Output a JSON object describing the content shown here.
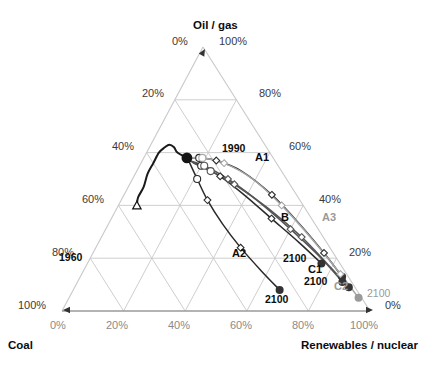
{
  "axes": {
    "top_title": "Oil / gas",
    "bottom_left_title": "Coal",
    "bottom_right_title": "Renewables / nuclear",
    "apex_left_tick": "0%",
    "apex_right_tick": "100%",
    "left_ticks": [
      "20%",
      "40%",
      "60%",
      "80%",
      "100%"
    ],
    "right_ticks": [
      "80%",
      "60%",
      "40%",
      "20%",
      "0%"
    ],
    "bottom_ticks": [
      "0%",
      "20%",
      "40%",
      "60%",
      "80%",
      "100%"
    ]
  },
  "annotations": {
    "historic_start": "1960",
    "branch_point": "1990",
    "a1": "A1",
    "a2": "A2",
    "a3": "A3",
    "b": "B",
    "c1": "C1",
    "c2": "C2",
    "end_a2": "2100",
    "end_b": "2100",
    "end_c1": "2100",
    "end_a3": "2100"
  },
  "colors": {
    "grid": "#c8c8c8",
    "axis": "#9a9a9a",
    "historic_line": "#1a1a1a",
    "scenario_dark": "#2a2a2a",
    "scenario_mid": "#555555",
    "scenario_light": "#a8a8a8",
    "marker_fill": "#ffffff",
    "endpoint_dark": "#333333",
    "endpoint_gray": "#9a9a9a",
    "text": "#111111",
    "text_gray": "#8a8a8a"
  },
  "chart_data": {
    "type": "line",
    "title": "",
    "subtitle": "",
    "plot_kind": "ternary",
    "axis_labels": {
      "top": "Oil / gas",
      "left": "Coal",
      "right": "Renewables / nuclear"
    },
    "axis_ranges": {
      "oil_gas": [
        0,
        100
      ],
      "coal": [
        0,
        100
      ],
      "renewables_nuclear": [
        0,
        100
      ]
    },
    "grid": true,
    "grid_interval": 20,
    "legend": "none",
    "units": "percent of primary energy",
    "note": "Each point is a share triple (coal, oil/gas, renewables+nuclear) summing to 100%.",
    "series": [
      {
        "name": "Historical 1960-1990",
        "style": "solid-black",
        "marker_start": "open-triangle",
        "marker_end": "large-filled-circle",
        "points": [
          {
            "label": "1960",
            "coal": 54,
            "oil_gas": 40,
            "ren_nuc": 6
          },
          {
            "coal": 52,
            "oil_gas": 43,
            "ren_nuc": 5
          },
          {
            "coal": 48,
            "oil_gas": 47,
            "ren_nuc": 5
          },
          {
            "coal": 44,
            "oil_gas": 52,
            "ren_nuc": 4
          },
          {
            "coal": 40,
            "oil_gas": 56,
            "ren_nuc": 4
          },
          {
            "coal": 36,
            "oil_gas": 60,
            "ren_nuc": 4
          },
          {
            "coal": 33,
            "oil_gas": 62,
            "ren_nuc": 5
          },
          {
            "coal": 31,
            "oil_gas": 63,
            "ren_nuc": 6
          },
          {
            "coal": 30,
            "oil_gas": 62,
            "ren_nuc": 8
          },
          {
            "coal": 30,
            "oil_gas": 60,
            "ren_nuc": 10
          },
          {
            "label": "1990",
            "coal": 28,
            "oil_gas": 58,
            "ren_nuc": 14
          }
        ]
      },
      {
        "name": "A1",
        "style": "solid-dark",
        "marker": "open-diamond",
        "marker_end": "filled-circle",
        "points": [
          {
            "coal": 28,
            "oil_gas": 58,
            "ren_nuc": 14
          },
          {
            "coal": 24,
            "oil_gas": 58,
            "ren_nuc": 18
          },
          {
            "coal": 19,
            "oil_gas": 57,
            "ren_nuc": 24
          },
          {
            "coal": 13,
            "oil_gas": 53,
            "ren_nuc": 34
          },
          {
            "coal": 8,
            "oil_gas": 44,
            "ren_nuc": 48
          },
          {
            "coal": 5,
            "oil_gas": 33,
            "ren_nuc": 62
          },
          {
            "coal": 3,
            "oil_gas": 22,
            "ren_nuc": 75
          },
          {
            "label": "2100",
            "coal": 2,
            "oil_gas": 13,
            "ren_nuc": 85
          }
        ]
      },
      {
        "name": "A2",
        "style": "solid-dark",
        "marker": "open-diamond",
        "marker_end": "filled-circle",
        "points": [
          {
            "coal": 28,
            "oil_gas": 57,
            "ren_nuc": 15
          },
          {
            "coal": 29,
            "oil_gas": 50,
            "ren_nuc": 21
          },
          {
            "coal": 30,
            "oil_gas": 42,
            "ren_nuc": 28
          },
          {
            "coal": 30,
            "oil_gas": 33,
            "ren_nuc": 37
          },
          {
            "coal": 29,
            "oil_gas": 24,
            "ren_nuc": 47
          },
          {
            "coal": 27,
            "oil_gas": 15,
            "ren_nuc": 58
          },
          {
            "label": "2100",
            "coal": 25,
            "oil_gas": 8,
            "ren_nuc": 67
          }
        ]
      },
      {
        "name": "A3",
        "style": "solid-light-gray",
        "marker": "open-diamond",
        "marker_end": "filled-circle-gray",
        "points": [
          {
            "coal": 28,
            "oil_gas": 58,
            "ren_nuc": 14
          },
          {
            "coal": 23,
            "oil_gas": 58,
            "ren_nuc": 19
          },
          {
            "coal": 17,
            "oil_gas": 56,
            "ren_nuc": 27
          },
          {
            "coal": 11,
            "oil_gas": 50,
            "ren_nuc": 39
          },
          {
            "coal": 7,
            "oil_gas": 40,
            "ren_nuc": 53
          },
          {
            "coal": 4,
            "oil_gas": 27,
            "ren_nuc": 69
          },
          {
            "coal": 2,
            "oil_gas": 14,
            "ren_nuc": 84
          },
          {
            "label": "2100",
            "coal": 1,
            "oil_gas": 5,
            "ren_nuc": 94
          }
        ]
      },
      {
        "name": "B",
        "style": "solid-dark",
        "marker": "open-diamond",
        "marker_end": "filled-circle",
        "points": [
          {
            "coal": 28,
            "oil_gas": 57,
            "ren_nuc": 15
          },
          {
            "coal": 25,
            "oil_gas": 55,
            "ren_nuc": 20
          },
          {
            "coal": 21,
            "oil_gas": 51,
            "ren_nuc": 28
          },
          {
            "coal": 17,
            "oil_gas": 44,
            "ren_nuc": 39
          },
          {
            "coal": 13,
            "oil_gas": 35,
            "ren_nuc": 52
          },
          {
            "coal": 9,
            "oil_gas": 26,
            "ren_nuc": 65
          },
          {
            "label": "2100",
            "coal": 6,
            "oil_gas": 18,
            "ren_nuc": 76
          }
        ]
      },
      {
        "name": "C1",
        "style": "solid-mid",
        "marker": "open-diamond",
        "marker_end": "filled-circle",
        "points": [
          {
            "coal": 28,
            "oil_gas": 57,
            "ren_nuc": 15
          },
          {
            "coal": 24,
            "oil_gas": 55,
            "ren_nuc": 21
          },
          {
            "coal": 19,
            "oil_gas": 50,
            "ren_nuc": 31
          },
          {
            "coal": 14,
            "oil_gas": 42,
            "ren_nuc": 44
          },
          {
            "coal": 9,
            "oil_gas": 31,
            "ren_nuc": 60
          },
          {
            "coal": 5,
            "oil_gas": 20,
            "ren_nuc": 75
          },
          {
            "label": "2100",
            "coal": 3,
            "oil_gas": 11,
            "ren_nuc": 86
          }
        ]
      },
      {
        "name": "C2",
        "style": "solid-mid",
        "marker": "open-diamond",
        "marker_end": "filled-circle",
        "points": [
          {
            "coal": 27,
            "oil_gas": 56,
            "ren_nuc": 17
          },
          {
            "coal": 23,
            "oil_gas": 53,
            "ren_nuc": 24
          },
          {
            "coal": 18,
            "oil_gas": 48,
            "ren_nuc": 34
          },
          {
            "coal": 12,
            "oil_gas": 39,
            "ren_nuc": 49
          },
          {
            "coal": 7,
            "oil_gas": 28,
            "ren_nuc": 65
          },
          {
            "coal": 4,
            "oil_gas": 17,
            "ren_nuc": 79
          },
          {
            "label": "2100",
            "coal": 2,
            "oil_gas": 9,
            "ren_nuc": 89
          }
        ]
      }
    ]
  }
}
